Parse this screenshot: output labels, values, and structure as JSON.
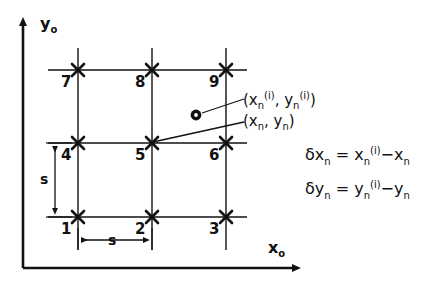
{
  "figure": {
    "axes": {
      "y_label": "y",
      "y_label_sub": "o",
      "x_label": "x",
      "x_label_sub": "o"
    },
    "grid": {
      "node_labels": [
        "1",
        "2",
        "3",
        "4",
        "5",
        "6",
        "7",
        "8",
        "9"
      ],
      "columns": 3,
      "rows": 3,
      "marker": "x-cross-marker"
    },
    "dimensions": {
      "horizontal_spacing_label": "s",
      "vertical_spacing_label": "s"
    },
    "annotations": {
      "deformed_point": {
        "open": "(x",
        "sub1": "n",
        "sup1": "(i)",
        "comma": ", y",
        "sub2": "n",
        "sup2": "(i)",
        "close": ")"
      },
      "reference_point": {
        "open": "(x",
        "sub1": "n",
        "comma": ", y",
        "sub2": "n",
        "close": ")"
      }
    },
    "equations": [
      {
        "lhs_symbol": "δx",
        "lhs_sub": "n",
        "equals": "=",
        "rhs_first": "x",
        "rhs_first_sub": "n",
        "rhs_first_sup": "(i)",
        "minus": "−",
        "rhs_second": "x",
        "rhs_second_sub": "n"
      },
      {
        "lhs_symbol": "δy",
        "lhs_sub": "n",
        "equals": "=",
        "rhs_first": "y",
        "rhs_first_sub": "n",
        "rhs_first_sup": "(i)",
        "minus": "−",
        "rhs_second": "y",
        "rhs_second_sub": "n"
      }
    ],
    "colors": {
      "ink": "#111111",
      "background": "#ffffff"
    }
  }
}
